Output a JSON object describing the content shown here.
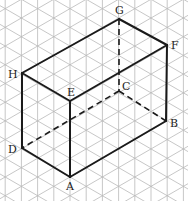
{
  "diagram": {
    "grid": {
      "type": "isometric-triangular",
      "vertical_spacing_px": 16.2,
      "color": "#b9b9b9"
    },
    "vertices": {
      "A": {
        "label": "A",
        "x": 70,
        "y": 177,
        "label_dx": -4,
        "label_dy": 13
      },
      "B": {
        "label": "B",
        "x": 166,
        "y": 121,
        "label_dx": 4,
        "label_dy": 6
      },
      "C": {
        "label": "C",
        "x": 119,
        "y": 91,
        "label_dx": 3,
        "label_dy": -1
      },
      "D": {
        "label": "D",
        "x": 22,
        "y": 148,
        "label_dx": -14,
        "label_dy": 5
      },
      "E": {
        "label": "E",
        "x": 70,
        "y": 101,
        "label_dx": -3,
        "label_dy": -5
      },
      "F": {
        "label": "F",
        "x": 167,
        "y": 45,
        "label_dx": 4,
        "label_dy": 4
      },
      "G": {
        "label": "G",
        "x": 119,
        "y": 19,
        "label_dx": -4,
        "label_dy": -5
      },
      "H": {
        "label": "H",
        "x": 22,
        "y": 73,
        "label_dx": -14,
        "label_dy": 5
      }
    },
    "edges_visible": [
      [
        "H",
        "E"
      ],
      [
        "E",
        "F"
      ],
      [
        "F",
        "G"
      ],
      [
        "G",
        "H"
      ],
      [
        "H",
        "D"
      ],
      [
        "E",
        "A"
      ],
      [
        "F",
        "B"
      ],
      [
        "D",
        "A"
      ],
      [
        "A",
        "B"
      ]
    ],
    "edges_hidden": [
      [
        "G",
        "C"
      ],
      [
        "C",
        "B"
      ],
      [
        "C",
        "D"
      ]
    ]
  }
}
